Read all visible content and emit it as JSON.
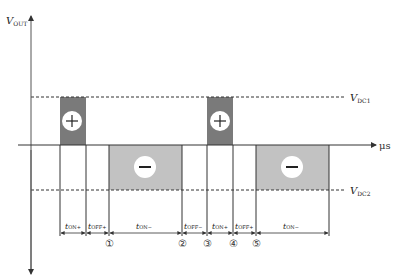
{
  "diagram": {
    "y_axis_label": "V",
    "y_axis_label_sub": "OUT",
    "x_axis_unit": "μs",
    "levels": {
      "vdc1": {
        "label": "V",
        "sub": "DC1"
      },
      "vdc2": {
        "label": "V",
        "sub": "DC2"
      }
    },
    "pulses": [
      {
        "type": "positive",
        "symbol": "+"
      },
      {
        "type": "negative",
        "symbol": "−"
      },
      {
        "type": "positive",
        "symbol": "+"
      },
      {
        "type": "negative",
        "symbol": "−"
      }
    ],
    "intervals": [
      {
        "t": "t",
        "sub": "ON+"
      },
      {
        "t": "t",
        "sub": "OFF+"
      },
      {
        "t": "t",
        "sub": "ON−"
      },
      {
        "t": "t",
        "sub": "OFF−"
      },
      {
        "t": "t",
        "sub": "ON+"
      },
      {
        "t": "t",
        "sub": "OFF+"
      },
      {
        "t": "t",
        "sub": "ON−"
      }
    ],
    "markers": [
      "①",
      "②",
      "③",
      "④",
      "⑤"
    ],
    "colors": {
      "positive_pulse": "#7a7a7a",
      "negative_pulse": "#c2c2c2",
      "axis": "#333333"
    }
  }
}
